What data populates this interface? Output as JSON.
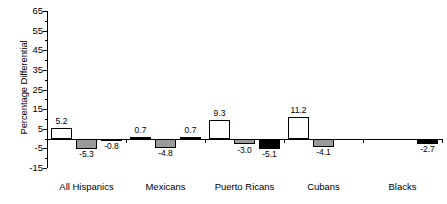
{
  "chart_data": {
    "type": "bar",
    "title": "",
    "xlabel": "",
    "ylabel": "Percentage Differential",
    "ylim": [
      -15,
      65
    ],
    "ytick_labels": [
      "65",
      "55",
      "45",
      "35",
      "25",
      "15",
      "5",
      "-5",
      "-15"
    ],
    "ytick_values": [
      65,
      55,
      45,
      35,
      25,
      15,
      5,
      -5,
      -15
    ],
    "grid": false,
    "legend": "none",
    "categories": [
      "All Hispanics",
      "Mexicans",
      "Puerto Ricans",
      "Cubans",
      "Blacks"
    ],
    "series": [
      {
        "name": "series-1",
        "color": "#ffffff",
        "values": [
          5.2,
          0.7,
          9.3,
          11.2,
          null
        ],
        "labels": [
          "5.2",
          "0.7",
          "9.3",
          "11.2",
          ""
        ]
      },
      {
        "name": "series-2",
        "color": "#9a9a9a",
        "values": [
          -5.3,
          -4.8,
          -3.0,
          -4.1,
          null
        ],
        "labels": [
          "-5.3",
          "-4.8",
          "-3.0",
          "-4.1",
          ""
        ]
      },
      {
        "name": "series-3",
        "color": "#000000",
        "values": [
          -0.8,
          0.7,
          -5.1,
          null,
          -2.7
        ],
        "labels": [
          "-0.8",
          "0.7",
          "-5.1",
          "",
          "-2.7"
        ]
      }
    ],
    "bars": [
      {
        "group": "All Hispanics",
        "series": "series-1",
        "value": 5.2,
        "label": "5.2",
        "fill": "white"
      },
      {
        "group": "All Hispanics",
        "series": "series-2",
        "value": -5.3,
        "label": "-5.3",
        "fill": "gray"
      },
      {
        "group": "All Hispanics",
        "series": "series-3",
        "value": -0.8,
        "label": "-0.8",
        "fill": "black"
      },
      {
        "group": "Mexicans",
        "series": "series-1",
        "value": 0.7,
        "label": "0.7",
        "fill": "white"
      },
      {
        "group": "Mexicans",
        "series": "series-2",
        "value": -4.8,
        "label": "-4.8",
        "fill": "gray"
      },
      {
        "group": "Mexicans",
        "series": "series-3",
        "value": 0.7,
        "label": "0.7",
        "fill": "black"
      },
      {
        "group": "Puerto Ricans",
        "series": "series-1",
        "value": 9.3,
        "label": "9.3",
        "fill": "white"
      },
      {
        "group": "Puerto Ricans",
        "series": "series-2",
        "value": -3.0,
        "label": "-3.0",
        "fill": "gray"
      },
      {
        "group": "Puerto Ricans",
        "series": "series-3",
        "value": -5.1,
        "label": "-5.1",
        "fill": "black"
      },
      {
        "group": "Cubans",
        "series": "series-1",
        "value": 11.2,
        "label": "11.2",
        "fill": "white"
      },
      {
        "group": "Cubans",
        "series": "series-2",
        "value": -4.1,
        "label": "-4.1",
        "fill": "gray"
      },
      {
        "group": "Blacks",
        "series": "series-3",
        "value": -2.7,
        "label": "-2.7",
        "fill": "black"
      }
    ]
  }
}
